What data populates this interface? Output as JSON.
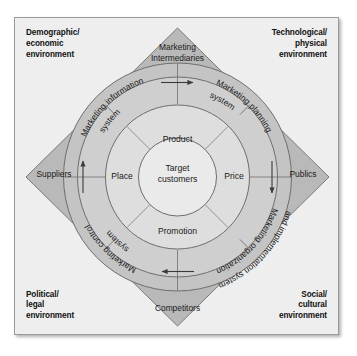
{
  "figure": {
    "colors": {
      "panel_background": "#eeeeee",
      "panel_border": "#9a9a9a",
      "diamond_fill": "#b9b9b9",
      "systems_ring_fill": "#c9c9c9",
      "mix_ring_fill": "#dcdcdc",
      "core_fill": "#e9e9e9",
      "stroke": "#6e6e6e",
      "text": "#1a1a1a"
    }
  },
  "macro_environment": {
    "top_left": "Demographic/\neconomic\nenvironment",
    "top_right": "Technological/\nphysical\nenvironment",
    "bottom_left": "Political/\nlegal\nenvironment",
    "bottom_right": "Social/\ncultural\nenvironment"
  },
  "micro_actors": {
    "top": "Marketing\nIntermediaries",
    "left": "Suppliers",
    "right": "Publics",
    "bottom": "Competitors"
  },
  "marketing_systems": {
    "upper_left": "Marketing information system",
    "upper_right": "Marketing planning system",
    "lower_left": "Marketing control system",
    "lower_right": "Marketing organization and implementation system"
  },
  "marketing_systems_lines": {
    "upper_left": [
      "Marketing information",
      "system"
    ],
    "upper_right": [
      "Marketing planning",
      "system"
    ],
    "lower_left": [
      "Marketing control",
      "system"
    ],
    "lower_right": [
      "Marketing organization",
      "and implementation system"
    ]
  },
  "flow_arrows": {
    "top": "arrow-right",
    "right": "arrow-down",
    "bottom": "arrow-left",
    "left": "arrow-up"
  },
  "marketing_mix": {
    "product": "Product",
    "price": "Price",
    "promotion": "Promotion",
    "place": "Place"
  },
  "core": {
    "label": "Target\ncustomers"
  }
}
